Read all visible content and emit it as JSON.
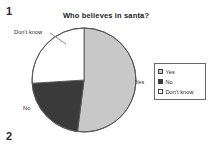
{
  "page": {
    "number_top": "1",
    "number_bottom": "2",
    "background_color": "#ffffff"
  },
  "figure": {
    "title": "Who believes in santa?",
    "pie_labels": {
      "dont_know": "Don't know",
      "no": "No",
      "yes": "Yes"
    }
  },
  "legend": {
    "items": [
      {
        "label": "Yes",
        "color": "#c8c8c8",
        "swatch": "light-gray-swatch"
      },
      {
        "label": "No",
        "color": "#3a3a3a",
        "swatch": "dark-swatch"
      },
      {
        "label": "Don't know",
        "color": "#ffffff",
        "swatch": "white-swatch"
      }
    ]
  },
  "chart_data": {
    "type": "pie",
    "title": "Who believes in santa?",
    "xlabel": "",
    "ylabel": "",
    "categories": [
      "Yes",
      "No",
      "Don't know"
    ],
    "values": [
      52,
      22,
      26
    ],
    "unit": "percent",
    "colors": [
      "#c8c8c8",
      "#3a3a3a",
      "#ffffff"
    ],
    "slice_angles_deg": {
      "start_angle": 0,
      "direction": "clockwise",
      "boundaries": [
        0,
        187,
        267,
        360
      ]
    },
    "legend": {
      "position": "right",
      "entries": [
        "Yes",
        "No",
        "Don't know"
      ]
    },
    "annotations": [
      {
        "text": "Yes",
        "attached_to": "Yes",
        "position": "right"
      },
      {
        "text": "No",
        "attached_to": "No",
        "position": "left-lower"
      },
      {
        "text": "Don't know",
        "attached_to": "Don't know",
        "position": "upper-left"
      }
    ],
    "grid": false,
    "outline_color": "#555555"
  }
}
